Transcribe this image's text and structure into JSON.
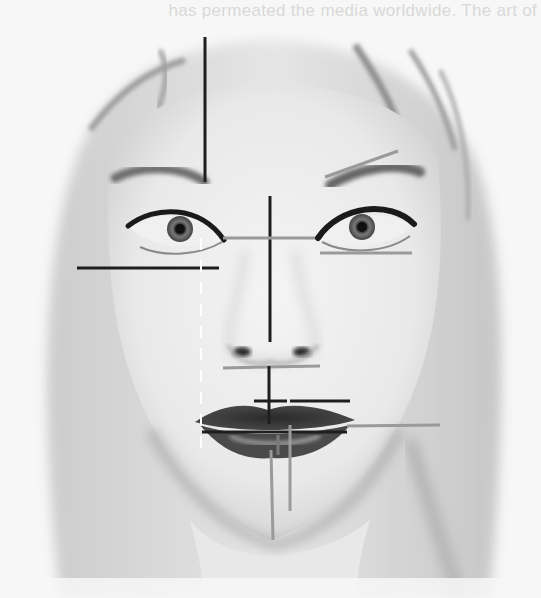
{
  "image": {
    "description": "Black-and-white portrait of a woman's face with facial proportion guide lines overlaid",
    "subject": "woman-face-portrait",
    "palette": {
      "background": "#f7f7f7",
      "skin": "#ececec",
      "shadow": "#bdbdbd",
      "hair": "#d0d0d0",
      "lips": "#3a3a3a",
      "line_dark": "#1e1e1e",
      "line_gray": "#9a9a9a",
      "line_dashed": "#ffffff"
    }
  },
  "bleed_through_text": {
    "line1": "has permeated the media worldwide. The art of",
    "line2": "",
    "line3": ""
  },
  "overlay": {
    "title": "Facial proportion guide lines",
    "lines": [
      {
        "name": "forehead-vertical-line",
        "style": "dark"
      },
      {
        "name": "nose-center-vertical-line",
        "style": "dark"
      },
      {
        "name": "eye-level-horizontal-line",
        "style": "gray"
      },
      {
        "name": "right-brow-angle-line",
        "style": "gray"
      },
      {
        "name": "right-under-eye-line",
        "style": "gray"
      },
      {
        "name": "left-cheek-horizontal-line",
        "style": "dark"
      },
      {
        "name": "nose-base-horizontal-line",
        "style": "gray"
      },
      {
        "name": "philtrum-vertical-line",
        "style": "dark"
      },
      {
        "name": "upper-lip-short-line",
        "style": "dark"
      },
      {
        "name": "upper-lip-right-line",
        "style": "dark"
      },
      {
        "name": "mouth-horizontal-line",
        "style": "dark"
      },
      {
        "name": "mouth-right-extension-line",
        "style": "gray"
      },
      {
        "name": "chin-vertical-line-left",
        "style": "gray"
      },
      {
        "name": "chin-vertical-line-right",
        "style": "gray"
      },
      {
        "name": "left-eye-dashed-vertical-line",
        "style": "dashed"
      }
    ]
  }
}
